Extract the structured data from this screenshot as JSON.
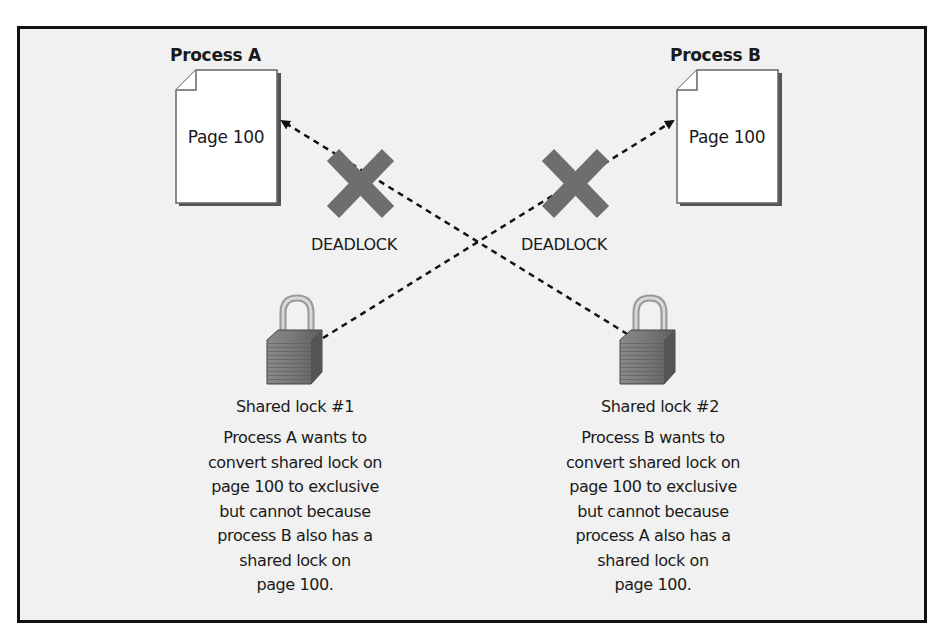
{
  "diagram": {
    "type": "deadlock-illustration",
    "processes": [
      {
        "title": "Process A",
        "page_label": "Page 100"
      },
      {
        "title": "Process B",
        "page_label": "Page 100"
      }
    ],
    "deadlock_labels": [
      "DEADLOCK",
      "DEADLOCK"
    ],
    "locks": [
      {
        "label": "Shared lock #1",
        "description": [
          "Process A wants to",
          "convert shared lock on",
          "page 100 to exclusive",
          "but cannot because",
          "process B also has a",
          "shared lock on",
          "page 100."
        ]
      },
      {
        "label": "Shared lock #2",
        "description": [
          "Process B wants to",
          "convert shared lock on",
          "page 100 to exclusive",
          "but cannot because",
          "process A also has a",
          "shared lock on",
          "page 100."
        ]
      }
    ],
    "edges": [
      {
        "from": "Shared lock #2",
        "to": "Process A page",
        "style": "dashed-arrow",
        "blocked": true
      },
      {
        "from": "Shared lock #1",
        "to": "Process B page",
        "style": "dashed-arrow",
        "blocked": true
      }
    ],
    "colors": {
      "frame_border": "#111111",
      "background": "#f1f1f1",
      "x_mark": "#6e6e6e",
      "lock": "#7a7a7a"
    }
  }
}
